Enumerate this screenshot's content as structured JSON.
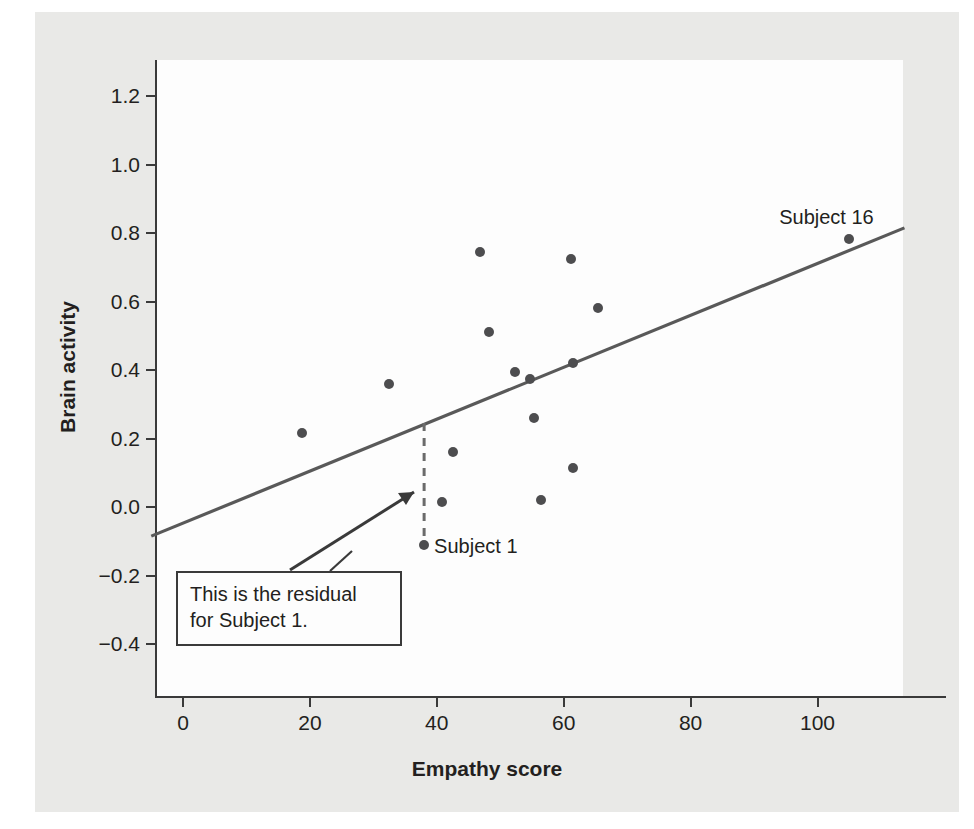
{
  "chart_data": {
    "type": "scatter",
    "title": "",
    "xlabel": "Empathy score",
    "ylabel": "Brain activity",
    "xlim": [
      -5,
      114
    ],
    "ylim": [
      -0.5,
      1.3
    ],
    "xticks": [
      0,
      20,
      40,
      60,
      80,
      100
    ],
    "xtick_labels": [
      "0",
      "20",
      "40",
      "60",
      "80",
      "100"
    ],
    "yticks": [
      -0.4,
      -0.2,
      0.0,
      0.2,
      0.4,
      0.6,
      0.8,
      1.0,
      1.2
    ],
    "ytick_labels": [
      "−0.4",
      "−0.2",
      "0.0",
      "0.2",
      "0.4",
      "0.6",
      "0.8",
      "1.0",
      "1.2"
    ],
    "grid": false,
    "legend": false,
    "point_color": "#4d4d4f",
    "line_color": "#595959",
    "points": [
      {
        "x": 18.8,
        "y": 0.215,
        "label": ""
      },
      {
        "x": 32.5,
        "y": 0.36,
        "label": ""
      },
      {
        "x": 38.0,
        "y": -0.11,
        "label": "Subject 1"
      },
      {
        "x": 42.5,
        "y": 0.16,
        "label": ""
      },
      {
        "x": 40.8,
        "y": 0.015,
        "label": ""
      },
      {
        "x": 46.8,
        "y": 0.745,
        "label": ""
      },
      {
        "x": 48.2,
        "y": 0.51,
        "label": ""
      },
      {
        "x": 52.4,
        "y": 0.395,
        "label": ""
      },
      {
        "x": 54.7,
        "y": 0.375,
        "label": ""
      },
      {
        "x": 55.3,
        "y": 0.26,
        "label": ""
      },
      {
        "x": 56.4,
        "y": 0.02,
        "label": ""
      },
      {
        "x": 61.2,
        "y": 0.725,
        "label": ""
      },
      {
        "x": 61.5,
        "y": 0.42,
        "label": ""
      },
      {
        "x": 61.4,
        "y": 0.115,
        "label": ""
      },
      {
        "x": 65.4,
        "y": 0.58,
        "label": ""
      },
      {
        "x": 105.0,
        "y": 0.783,
        "label": "Subject 16"
      }
    ],
    "regression_line": {
      "x_start": -5.0,
      "y_start": -0.085,
      "x_end": 113.7,
      "y_end": 0.815
    },
    "residual_marker": {
      "x": 38.0,
      "y_point": -0.11,
      "y_line": 0.245,
      "style": "dashed"
    },
    "annotations": [
      {
        "name": "subject-1-label",
        "text": "Subject 1"
      },
      {
        "name": "subject-16-label",
        "text": "Subject 16"
      },
      {
        "name": "residual-callout",
        "line1": "This is the residual",
        "line2": "for Subject 1."
      }
    ]
  }
}
